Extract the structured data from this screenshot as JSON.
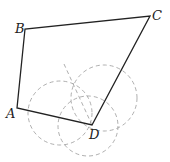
{
  "diagram": {
    "type": "geometry-construction",
    "points": {
      "A": {
        "label": "A",
        "x": 17,
        "y": 108
      },
      "B": {
        "label": "B",
        "x": 25,
        "y": 29
      },
      "C": {
        "label": "C",
        "x": 150,
        "y": 16
      },
      "D": {
        "label": "D",
        "x": 92,
        "y": 125
      }
    },
    "polygon": [
      "A",
      "B",
      "C",
      "D"
    ],
    "construction_circles": [
      {
        "cx": 60,
        "cy": 113,
        "r": 32
      },
      {
        "cx": 104,
        "cy": 98,
        "r": 33
      },
      {
        "cx": 88,
        "cy": 126,
        "r": 30
      }
    ],
    "construction_line": {
      "x1": 64,
      "y1": 64,
      "x2": 92,
      "y2": 125
    },
    "colors": {
      "stroke": "#222222",
      "construction": "#999999"
    }
  }
}
